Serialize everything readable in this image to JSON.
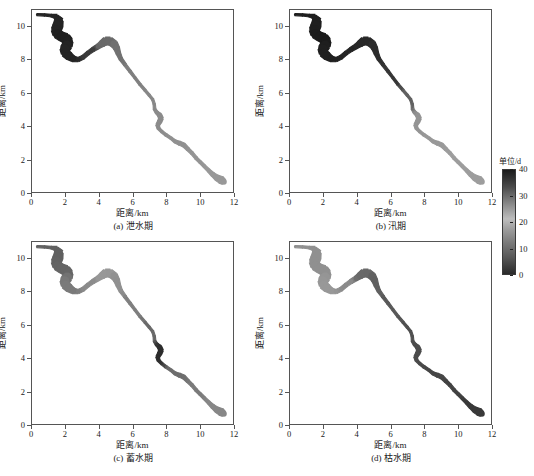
{
  "figure": {
    "background": "#ffffff",
    "axis_color": "#555555",
    "text_color": "#1a1a1a"
  },
  "axes": {
    "xlabel": "距离/km",
    "ylabel": "距离/km",
    "xticks": [
      "0",
      "2",
      "4",
      "6",
      "8",
      "10",
      "12"
    ],
    "xtick_values": [
      0,
      2,
      4,
      6,
      8,
      10,
      12
    ],
    "yticks": [
      "0",
      "2",
      "4",
      "6",
      "8",
      "10"
    ],
    "ytick_values": [
      0,
      2,
      4,
      6,
      8,
      10
    ],
    "xlim": [
      0,
      12
    ],
    "ylim": [
      0,
      11
    ]
  },
  "panels": [
    {
      "id": "a",
      "caption": "(a) 泄水期"
    },
    {
      "id": "b",
      "caption": "(b) 汛期"
    },
    {
      "id": "c",
      "caption": "(c) 蓄水期"
    },
    {
      "id": "d",
      "caption": "(d) 枯水期"
    }
  ],
  "colorbar": {
    "title": "单位/d",
    "ticks": [
      "40",
      "30",
      "20",
      "10",
      "0"
    ],
    "tick_values": [
      40,
      30,
      20,
      10,
      0
    ],
    "vmin": 0,
    "vmax": 40,
    "colormap": "grayscale-dark-to-light",
    "color_high": "#1b1b1b",
    "color_low": "#c8c8c8"
  },
  "chart_data": {
    "type": "heatmap",
    "title": "",
    "xlabel": "距离/km",
    "ylabel": "距离/km",
    "xlim": [
      0,
      12
    ],
    "ylim": [
      0,
      11
    ],
    "grid": false,
    "legend_position": "right",
    "colorbar_label": "单位/d",
    "colorbar_range": [
      0,
      40
    ],
    "panels": [
      {
        "id": "a",
        "caption": "(a) 泄水期",
        "reach_values": [
          {
            "x": 1.6,
            "y": 10.3,
            "value": 38
          },
          {
            "x": 2.0,
            "y": 9.4,
            "value": 39
          },
          {
            "x": 2.3,
            "y": 8.4,
            "value": 38
          },
          {
            "x": 3.3,
            "y": 8.6,
            "value": 33
          },
          {
            "x": 4.3,
            "y": 9.0,
            "value": 22
          },
          {
            "x": 5.0,
            "y": 8.6,
            "value": 20
          },
          {
            "x": 6.0,
            "y": 7.0,
            "value": 17
          },
          {
            "x": 7.2,
            "y": 5.6,
            "value": 15
          },
          {
            "x": 7.6,
            "y": 4.3,
            "value": 14
          },
          {
            "x": 8.6,
            "y": 3.0,
            "value": 13
          },
          {
            "x": 9.6,
            "y": 2.1,
            "value": 12
          },
          {
            "x": 10.8,
            "y": 0.9,
            "value": 11
          }
        ]
      },
      {
        "id": "b",
        "caption": "(b) 汛期",
        "reach_values": [
          {
            "x": 1.6,
            "y": 10.3,
            "value": 39
          },
          {
            "x": 2.0,
            "y": 9.4,
            "value": 40
          },
          {
            "x": 2.3,
            "y": 8.4,
            "value": 39
          },
          {
            "x": 3.3,
            "y": 8.6,
            "value": 38
          },
          {
            "x": 4.3,
            "y": 9.0,
            "value": 37
          },
          {
            "x": 5.0,
            "y": 8.6,
            "value": 36
          },
          {
            "x": 6.0,
            "y": 7.0,
            "value": 34
          },
          {
            "x": 7.2,
            "y": 5.6,
            "value": 24
          },
          {
            "x": 7.6,
            "y": 4.3,
            "value": 12
          },
          {
            "x": 8.6,
            "y": 3.0,
            "value": 11
          },
          {
            "x": 9.6,
            "y": 2.1,
            "value": 10
          },
          {
            "x": 10.8,
            "y": 0.9,
            "value": 10
          }
        ]
      },
      {
        "id": "c",
        "caption": "(c) 蓄水期",
        "reach_values": [
          {
            "x": 1.6,
            "y": 10.3,
            "value": 24
          },
          {
            "x": 2.0,
            "y": 9.4,
            "value": 23
          },
          {
            "x": 2.3,
            "y": 8.4,
            "value": 18
          },
          {
            "x": 3.3,
            "y": 8.6,
            "value": 14
          },
          {
            "x": 4.3,
            "y": 9.0,
            "value": 11
          },
          {
            "x": 5.0,
            "y": 8.6,
            "value": 13
          },
          {
            "x": 6.0,
            "y": 7.0,
            "value": 17
          },
          {
            "x": 7.2,
            "y": 5.6,
            "value": 22
          },
          {
            "x": 7.6,
            "y": 4.3,
            "value": 36
          },
          {
            "x": 8.6,
            "y": 3.0,
            "value": 21
          },
          {
            "x": 9.6,
            "y": 2.1,
            "value": 18
          },
          {
            "x": 10.8,
            "y": 0.9,
            "value": 15
          }
        ]
      },
      {
        "id": "d",
        "caption": "(d) 枯水期",
        "reach_values": [
          {
            "x": 1.6,
            "y": 10.3,
            "value": 13
          },
          {
            "x": 2.0,
            "y": 9.4,
            "value": 13
          },
          {
            "x": 2.3,
            "y": 8.4,
            "value": 11
          },
          {
            "x": 3.3,
            "y": 8.6,
            "value": 14
          },
          {
            "x": 4.3,
            "y": 9.0,
            "value": 22
          },
          {
            "x": 5.0,
            "y": 8.6,
            "value": 24
          },
          {
            "x": 6.0,
            "y": 7.0,
            "value": 26
          },
          {
            "x": 7.2,
            "y": 5.6,
            "value": 28
          },
          {
            "x": 7.6,
            "y": 4.3,
            "value": 29
          },
          {
            "x": 8.6,
            "y": 3.0,
            "value": 30
          },
          {
            "x": 9.6,
            "y": 2.1,
            "value": 31
          },
          {
            "x": 10.8,
            "y": 0.9,
            "value": 33
          }
        ]
      }
    ]
  }
}
